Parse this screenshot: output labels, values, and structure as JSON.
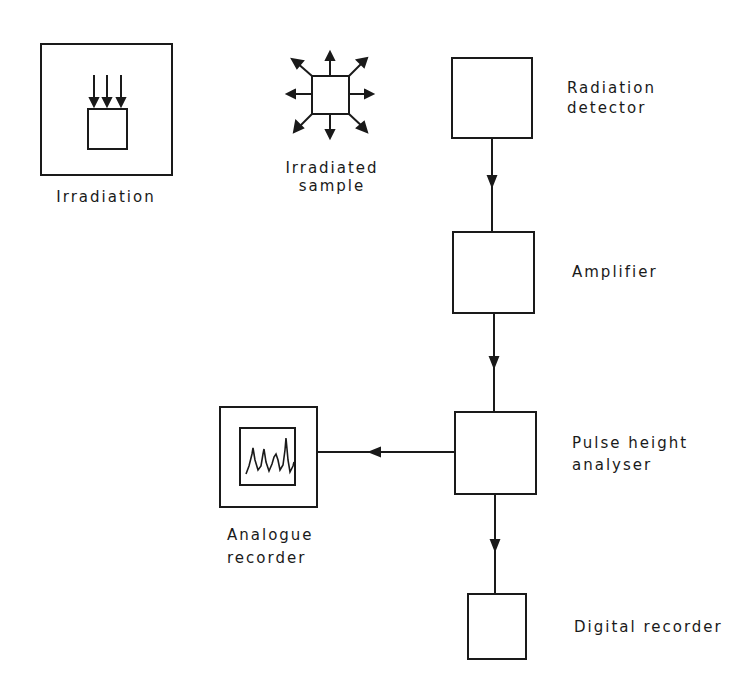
{
  "diagram": {
    "type": "block-flow",
    "colors": {
      "stroke": "#1a1a1a",
      "background": "#ffffff"
    },
    "nodes": {
      "irradiation": {
        "label": "Irradiation",
        "icon": "irradiation-chamber-icon"
      },
      "irradiated_sample": {
        "label_line1": "Irradiated",
        "label_line2": "sample",
        "icon": "emitting-sample-icon"
      },
      "radiation_detector": {
        "label_line1": "Radiation",
        "label_line2": "detector"
      },
      "amplifier": {
        "label": "Amplifier"
      },
      "pulse_height_analyser": {
        "label_line1": "Pulse height",
        "label_line2": "analyser"
      },
      "analogue_recorder": {
        "label_line1": "Analogue",
        "label_line2": "recorder",
        "icon": "spectrum-trace-icon"
      },
      "digital_recorder": {
        "label": "Digital recorder"
      }
    },
    "edges": [
      {
        "from": "Radiation detector",
        "to": "Amplifier"
      },
      {
        "from": "Amplifier",
        "to": "Pulse height analyser"
      },
      {
        "from": "Pulse height analyser",
        "to": "Analogue recorder"
      },
      {
        "from": "Pulse height analyser",
        "to": "Digital recorder"
      }
    ]
  }
}
